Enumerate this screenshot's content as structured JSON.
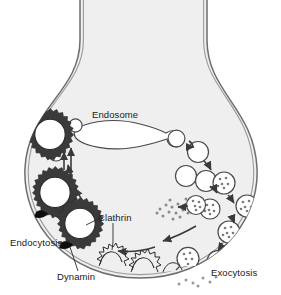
{
  "figure": {
    "type": "biological-process-diagram",
    "background_color": "#ffffff",
    "cytoplasm_color": "#efefef",
    "membrane_color": "#6e6e6e",
    "ink_color": "#2b2b2b",
    "label_color": "#1a1a1a"
  },
  "labels": {
    "endosome": "Endosome",
    "clathrin": "Clathrin",
    "endocytosis": "Endocytosis",
    "dynamin": "Dynamin",
    "exocytosis": "Exocytosis"
  },
  "structures": {
    "terminal": "presynaptic-axon-terminal",
    "endosome_shape": "lens-shaped-organelle-with-two-buds",
    "coated_vesicles": 3,
    "uncoated_vesicles": 5,
    "filled_vesicles": 7,
    "coated_pits": 3,
    "fusing_vesicles": 2,
    "neurotransmitter_clouds": 2
  },
  "cycle_steps": [
    {
      "step": 1,
      "name": "Exocytosis",
      "location": "bottom-right membrane"
    },
    {
      "step": 2,
      "name": "Endocytosis",
      "location": "bottom-left membrane"
    },
    {
      "step": 3,
      "name": "Clathrin coating",
      "location": "left"
    },
    {
      "step": 4,
      "name": "Dynamin scission",
      "location": "bottom-left"
    },
    {
      "step": 5,
      "name": "Uncoating",
      "location": "upper-left"
    },
    {
      "step": 6,
      "name": "Endosome fusion",
      "location": "center"
    },
    {
      "step": 7,
      "name": "Budding and refilling",
      "location": "right"
    }
  ]
}
